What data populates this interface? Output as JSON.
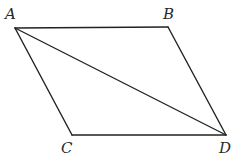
{
  "diagram": {
    "type": "geometry",
    "shape": "parallelogram",
    "stroke_color": "#222222",
    "vertices": {
      "A": {
        "x": 15,
        "y": 28,
        "label": "A",
        "label_x": 5,
        "label_y": 19
      },
      "B": {
        "x": 168,
        "y": 27,
        "label": "B",
        "label_x": 163,
        "label_y": 19
      },
      "C": {
        "x": 72,
        "y": 135,
        "label": "C",
        "label_x": 61,
        "label_y": 153
      },
      "D": {
        "x": 226,
        "y": 135,
        "label": "D",
        "label_x": 219,
        "label_y": 153
      }
    },
    "edges": [
      {
        "from": "A",
        "to": "B",
        "name": "side-ab"
      },
      {
        "from": "B",
        "to": "D",
        "name": "side-bd"
      },
      {
        "from": "D",
        "to": "C",
        "name": "side-dc"
      },
      {
        "from": "C",
        "to": "A",
        "name": "side-ca"
      },
      {
        "from": "A",
        "to": "D",
        "name": "diagonal-ad"
      }
    ]
  }
}
